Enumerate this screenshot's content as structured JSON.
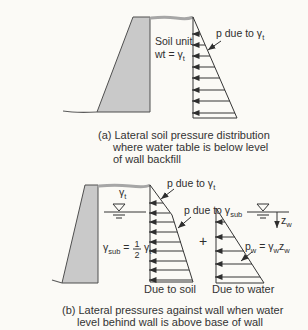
{
  "colors": {
    "background": "#fbfaf6",
    "wall_fill": "#c9c9c9",
    "wall_stroke": "#4f4f4f",
    "line": "#353535",
    "ground_gray": "#a6a6a6",
    "text": "#2e2e2e"
  },
  "figure": {
    "a": {
      "soil_unit_line1": "Soil unit",
      "soil_unit_line2_pre": "wt = γ",
      "soil_unit_line2_sub": "t",
      "p_label_pre": "p due to γ",
      "p_label_sub": "t",
      "caption_line1": "(a) Lateral soil pressure distribution",
      "caption_line2": "where water table is below level",
      "caption_line3": "of wall backfill"
    },
    "b": {
      "gamma_t_pre": "γ",
      "gamma_t_sub": "t",
      "gamma_sub_pre": "γ",
      "gamma_sub_sub": "sub",
      "gamma_sub_eq": " =",
      "frac_num": "1",
      "frac_den": "2",
      "gamma_t2_pre": "γ",
      "gamma_t2_sub": "t",
      "p_gamma_t_pre": "p due to γ",
      "p_gamma_t_sub": "t",
      "p_gamma_sub_pre": "p due to γ",
      "p_gamma_sub_sub": "sub",
      "plus": "+",
      "pw_p": "p",
      "pw_p_sub": "w",
      "pw_eq": " = γ",
      "pw_g_sub": "w",
      "pw_z": "z",
      "pw_z_sub": "w",
      "zw_pre": "z",
      "zw_sub": "w",
      "due_to_soil": "Due to soil",
      "due_to_water": "Due to water",
      "caption_line1": "(b) Lateral pressures against wall when water",
      "caption_line2": "level behind wall is above base of wall"
    }
  }
}
